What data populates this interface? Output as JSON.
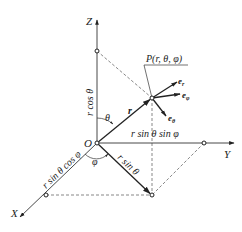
{
  "diagram": {
    "axes": {
      "z_label": "Z",
      "y_label": "Y",
      "x_label": "X",
      "origin_label": "O"
    },
    "point": {
      "label": "P(r, θ, φ)"
    },
    "vectors": {
      "position": "r",
      "e_r": "e",
      "e_r_sub": "r",
      "e_phi": "e",
      "e_phi_sub": "φ",
      "e_theta": "e",
      "e_theta_sub": "θ"
    },
    "angles": {
      "theta": "θ",
      "phi": "φ"
    },
    "lengths": {
      "z_projection": "r cos θ",
      "y_projection": "r sin θ sin φ",
      "x_projection": "r sin θ cos φ",
      "xy_projection": "r sin θ"
    },
    "colors": {
      "line": "#333333",
      "background": "#ffffff"
    }
  }
}
